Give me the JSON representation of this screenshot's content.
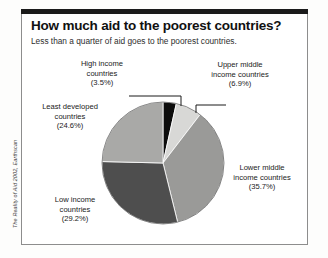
{
  "figure": {
    "title": "How much aid to the poorest countries?",
    "subtitle": "Less than a quarter of aid goes to the poorest countries.",
    "source_credit": "The Reality of Aid 2002, Earthscan"
  },
  "labels": {
    "high_income": {
      "line1": "High income",
      "line2": "countries",
      "pct": "(3.5%)"
    },
    "upper_middle": {
      "line1": "Upper middle",
      "line2": "income countries",
      "pct": "(6.9%)"
    },
    "least_developed": {
      "line1": "Least developed",
      "line2": "countries",
      "pct": "(24.6%)"
    },
    "lower_middle": {
      "line1": "Lower middle",
      "line2": "income countries",
      "pct": "(35.7%)"
    },
    "low_income": {
      "line1": "Low income",
      "line2": "countries",
      "pct": "(29.2%)"
    }
  },
  "colors": {
    "high_income": "#0d0d0d",
    "upper_middle": "#d8d8d6",
    "lower_middle": "#9a9a98",
    "low_income": "#4e4e4e",
    "least_developed": "#a9a9a7",
    "frame": "#8d8d8d",
    "top_rule": "#1b1b1b",
    "text": "#1a1a1a"
  },
  "chart_data": {
    "type": "pie",
    "title": "How much aid to the poorest countries?",
    "subtitle": "Less than a quarter of aid goes to the poorest countries.",
    "unit": "percent of total aid",
    "start_angle_deg": 0,
    "direction": "clockwise",
    "legend": "labels-with-leader-lines",
    "grid": false,
    "categories": [
      "High income countries",
      "Upper middle income countries",
      "Lower middle income countries",
      "Low income countries",
      "Least developed countries"
    ],
    "values": [
      3.5,
      6.9,
      35.7,
      29.2,
      24.6
    ],
    "slice_colors": [
      "#0d0d0d",
      "#d8d8d6",
      "#9a9a98",
      "#4e4e4e",
      "#a9a9a7"
    ],
    "data_labels": [
      "(3.5%)",
      "(6.9%)",
      "(35.7%)",
      "(29.2%)",
      "(24.6%)"
    ],
    "total": 99.9
  }
}
